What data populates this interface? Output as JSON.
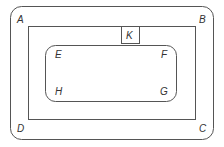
{
  "diagram": {
    "stroke_color": "#555555",
    "outer_region": {
      "corner_labels": {
        "A": "A",
        "B": "B",
        "C": "C",
        "D": "D"
      }
    },
    "inner_rectangle": {
      "box_label": "K"
    },
    "rounded_region": {
      "corner_labels": {
        "E": "E",
        "F": "F",
        "G": "G",
        "H": "H"
      }
    }
  }
}
